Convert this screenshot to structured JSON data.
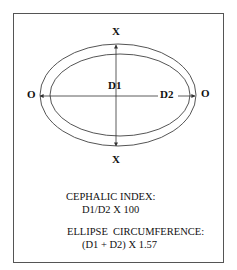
{
  "diagram": {
    "labels": {
      "top": "X",
      "bottom": "X",
      "left": "O",
      "right": "O",
      "d1": "D1",
      "d2": "D2"
    },
    "formulas": {
      "cephalic_title": "CEPHALIC INDEX:",
      "cephalic_expr": "D1/D2 X 100",
      "circumference_title": "ELLIPSE  CIRCUMFERENCE:",
      "circumference_expr": "(D1 + D2) X 1.57"
    },
    "colors": {
      "line": "#444444",
      "text": "#111111"
    }
  }
}
